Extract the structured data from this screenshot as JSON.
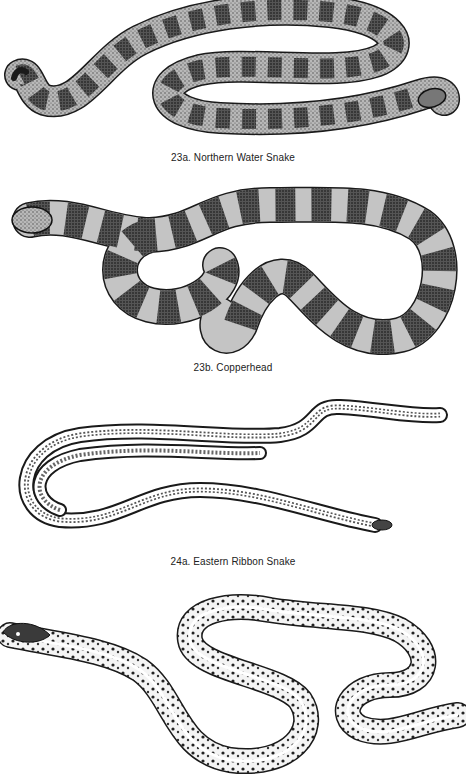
{
  "plates": [
    {
      "id": "23a",
      "caption": "23a. Northern Water Snake",
      "illustration": "northern-water-snake"
    },
    {
      "id": "23b",
      "caption": "23b. Copperhead",
      "illustration": "copperhead"
    },
    {
      "id": "24a",
      "caption": "24a. Eastern Ribbon Snake",
      "illustration": "eastern-ribbon-snake"
    },
    {
      "id": "24b",
      "caption": "",
      "illustration": "garter-snake"
    }
  ],
  "colors": {
    "ink": "#1a1a1a",
    "paper": "#ffffff",
    "mid": "#8a8a8a",
    "light": "#cfcfcf"
  }
}
